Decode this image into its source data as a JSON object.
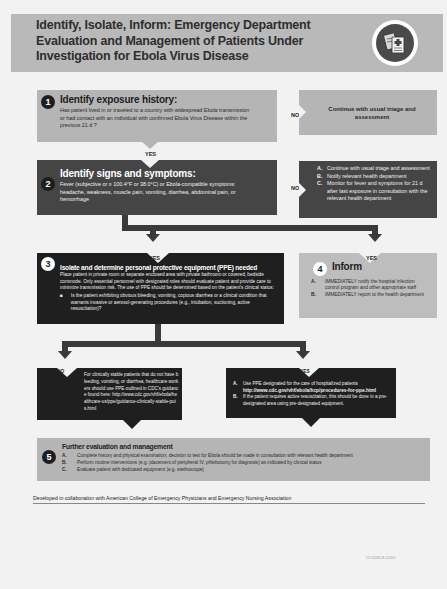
{
  "header": {
    "title": "Identify, Isolate, Inform: Emergency Department Evaluation and Management of Patients Under Investigation for Ebola Virus Disease",
    "icon": "medical-documents-icon"
  },
  "step1": {
    "number": "1",
    "title": "Identify exposure history:",
    "text": "Has patient lived in or traveled to a country with widespread Ebola transmission or had contact with an individual with confirmed Ebola Virus Disease within the previous 21 d ?",
    "no_label": "NO",
    "no_action": "Continue with usual triage and assessment",
    "yes_label": "YES"
  },
  "step2": {
    "number": "2",
    "title": "Identify signs and symptoms:",
    "text": "Fever (subjective or ≥ 100.4°F or 38.0°C) or Ebola-compatible symptoms: headache, weakness, muscle pain, vomiting, diarrhea, abdominal pain, or hemorrhage",
    "no_label": "NO",
    "no_actions": [
      {
        "key": "A.",
        "text": "Continue with usual triage and assessment"
      },
      {
        "key": "B.",
        "text": "Notify relevant health department"
      },
      {
        "key": "C.",
        "text": "Monitor for fever and symptoms for 21 d after last exposure in consultation with the relevant health department"
      }
    ]
  },
  "step3": {
    "number": "3",
    "yes_label": "YES",
    "title": "Isolate and determine personal protective equipment (PPE) needed",
    "text": "Place patient in private room or separate enclosed area with private bathroom or covered, bedside commode. Only essential personnel with designated roles should evaluate patient and provide care to minimize transmission risk. The use of PPE should be determined based on the patient's clinical status:",
    "bullet": "Is the patient exhibiting obvious bleeding, vomiting, copious diarrhea or a clinical condition that warrants invasive or aerosol-generating procedures (e.g., intubation, suctioning, active resuscitation)?"
  },
  "step4": {
    "number": "4",
    "yes_label": "YES",
    "title": "Inform",
    "items": [
      {
        "key": "A.",
        "text": "IMMEDIATELY notify the hospital infection control program and other appropriate staff"
      },
      {
        "key": "B.",
        "text": "IMMEDIATELY report to the health department"
      }
    ]
  },
  "branch_no": {
    "label": "NO",
    "text": "For clinically stable patients that do not have bleeding, vomiting, or diarrhea, healthcare workers should use PPE outlined in CDC's guidance found here: http://www.cdc.gov/vhf/ebola/healthcare-us/ppe/guidance-clinically-stable-puis.html"
  },
  "branch_yes": {
    "label": "YES",
    "items": [
      {
        "key": "A.",
        "text": "Use PPE designated for the care of hospitalized patients",
        "link": "http://www.cdc.gov/vhf/ebola/hcp/procedures-for-ppe.html"
      },
      {
        "key": "B.",
        "text": "If the patient requires active resuscitation, this should be done in a pre-designated area using pre-designated equipment."
      }
    ]
  },
  "step5": {
    "number": "5",
    "title": "Further evaluation and management",
    "items": [
      {
        "key": "A.",
        "text": "Complete history and physical examination; decision to test for Ebola should be made in consultation with relevant health department"
      },
      {
        "key": "B.",
        "text": "Perform routine interventions (e.g. placement of peripheral IV, phlebotomy for diagnosis) as indicated by clinical status"
      },
      {
        "key": "C.",
        "text": "Evaluate patient with dedicated equipment (e.g. stethoscope)"
      }
    ]
  },
  "footer": {
    "collaboration": "Developed in collaboration with American College of Emergency Physicians and Emergency Nursing Association",
    "doc_code": "CS 251835-B 12/2015"
  },
  "colors": {
    "light_box": "#b5b5b5",
    "dark_box": "#454545",
    "black_box": "#1f1f1f",
    "background": "#f2f2f2"
  }
}
